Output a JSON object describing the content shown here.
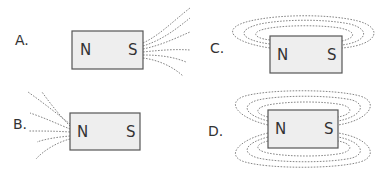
{
  "options": [
    {
      "label": "A.",
      "north": "N",
      "south": "S",
      "description": "Field lines fan out from the S pole only"
    },
    {
      "label": "B.",
      "north": "N",
      "south": "S",
      "description": "Field lines fan out from the N pole only"
    },
    {
      "label": "C.",
      "north": "N",
      "south": "S",
      "description": "Field lines loop above the magnet from N to S"
    },
    {
      "label": "D.",
      "north": "N",
      "south": "S",
      "description": "Field lines loop above and below the magnet from N to S"
    }
  ],
  "colors": {
    "magnet_fill": "#eeeeee",
    "magnet_border": "#555555",
    "field_line": "#777777",
    "text": "#333333"
  }
}
